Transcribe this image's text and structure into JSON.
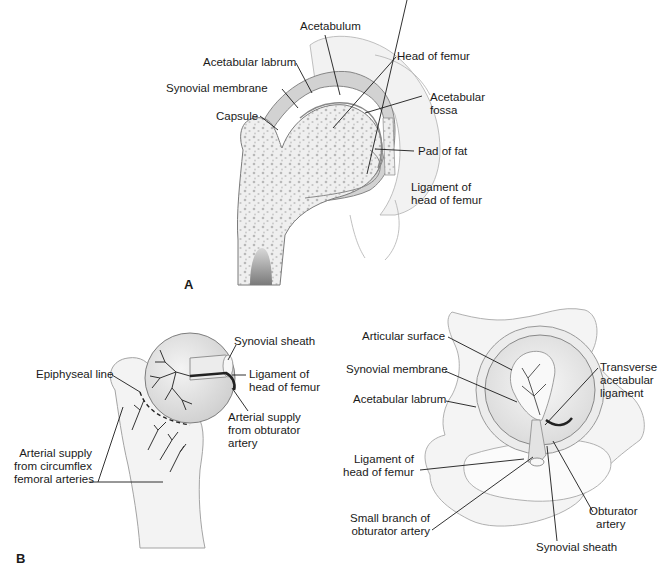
{
  "figure": {
    "panels": [
      {
        "id": "A",
        "letter": "A",
        "description": "Coronal section of hip joint",
        "labels": {
          "acetabulum": "Acetabulum",
          "acetabular_labrum": "Acetabular labrum",
          "head_of_femur": "Head of femur",
          "synovial_membrane": "Synovial membrane",
          "acetabular_fossa_1": "Acetabular",
          "acetabular_fossa_2": "fossa",
          "capsule": "Capsule",
          "pad_of_fat": "Pad of fat",
          "ligament_head_femur_1": "Ligament of",
          "ligament_head_femur_2": "head of femur"
        }
      },
      {
        "id": "B",
        "letter": "B",
        "description": "Blood supply of femoral head and acetabulum",
        "left_labels": {
          "synovial_sheath": "Synovial sheath",
          "epiphyseal_line": "Epiphyseal line",
          "ligament_head_femur_1": "Ligament of",
          "ligament_head_femur_2": "head of femur",
          "arterial_obturator_1": "Arterial supply",
          "arterial_obturator_2": "from obturator",
          "arterial_obturator_3": "artery",
          "arterial_circumflex_1": "Arterial supply",
          "arterial_circumflex_2": "from circumflex",
          "arterial_circumflex_3": "femoral arteries"
        },
        "right_labels": {
          "articular_surface": "Articular surface",
          "synovial_membrane": "Synovial membrane",
          "acetabular_labrum": "Acetabular labrum",
          "transverse_1": "Transverse",
          "transverse_2": "acetabular",
          "transverse_3": "ligament",
          "ligament_head_femur_1": "Ligament of",
          "ligament_head_femur_2": "head of femur",
          "small_branch_1": "Small branch of",
          "small_branch_2": "obturator artery",
          "obturator_artery_1": "Obturator",
          "obturator_artery_2": "artery",
          "synovial_sheath": "Synovial sheath"
        }
      }
    ]
  },
  "colors": {
    "ink": "#1a1a1a",
    "bone_fill": "#eeeeee",
    "bone_dots": "#b5b5b5",
    "capsule_fill": "#cfcfcf",
    "outline": "#8a8a8a"
  }
}
